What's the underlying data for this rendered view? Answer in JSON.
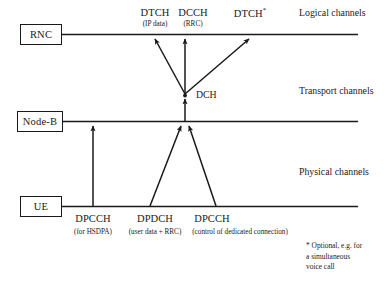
{
  "diagram": {
    "nodes": [
      {
        "id": "rnc",
        "label": "RNC"
      },
      {
        "id": "nodeb",
        "label": "Node-B"
      },
      {
        "id": "ue",
        "label": "UE"
      }
    ],
    "layer_labels": [
      {
        "id": "logical",
        "label": "Logical channels"
      },
      {
        "id": "transport",
        "label": "Transport channels"
      },
      {
        "id": "physical",
        "label": "Physical channels"
      }
    ],
    "logical_channels": [
      {
        "id": "dtch-ip",
        "name": "DTCH",
        "detail": "(IP data)",
        "optional": false
      },
      {
        "id": "dcch-rrc",
        "name": "DCCH",
        "detail": "(RRC)",
        "optional": false
      },
      {
        "id": "dtch-opt",
        "name": "DTCH",
        "detail": "",
        "optional": true,
        "marker": "*"
      }
    ],
    "transport_channels": [
      {
        "id": "dch",
        "name": "DCH"
      }
    ],
    "physical_channels": [
      {
        "id": "dpcch-hsdpa",
        "name": "DPCCH",
        "detail": "(for HSDPA)"
      },
      {
        "id": "dpdch",
        "name": "DPDCH",
        "detail": "(user data + RRC)"
      },
      {
        "id": "dpcch-ded",
        "name": "DPCCH",
        "detail": "(control of dedicated connection)"
      }
    ],
    "footnote": {
      "line1": "* Optional, e.g. for",
      "line2": "a simultaneous",
      "line3": "voice call"
    },
    "colors": {
      "ink": "#1a1a1a",
      "background": "#ffffff"
    }
  }
}
